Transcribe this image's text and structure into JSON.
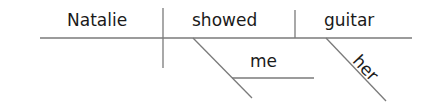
{
  "diagram": {
    "type": "sentence-diagram",
    "sentence": "Natalie showed me her guitar",
    "subject": "Natalie",
    "verb": "showed",
    "direct_object": "guitar",
    "indirect_object": "me",
    "modifier_of_direct_object": "her",
    "colors": {
      "line": "#7a7a7a",
      "text": "#1a1a1a"
    }
  }
}
